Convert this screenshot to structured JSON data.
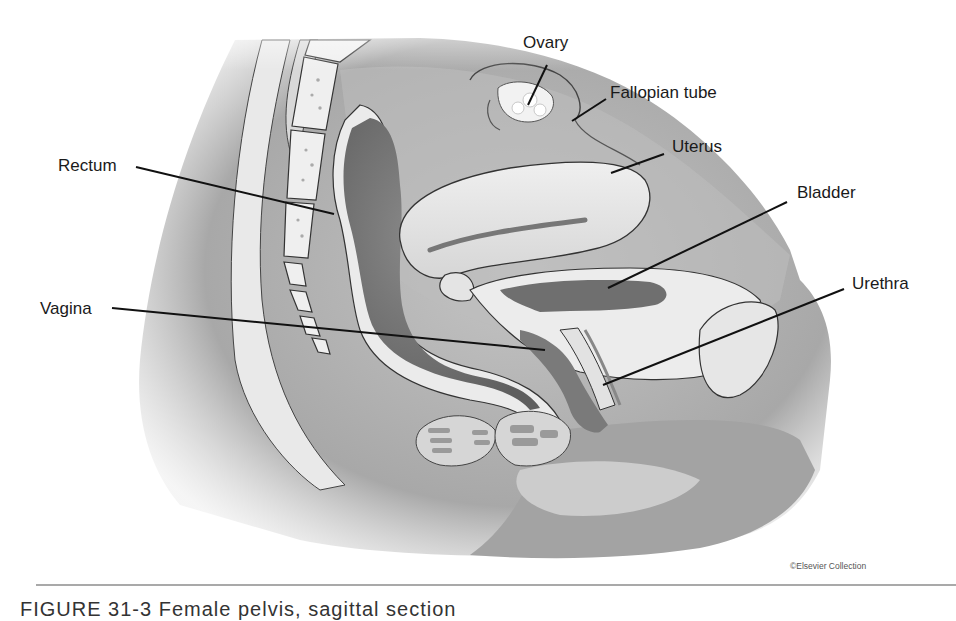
{
  "figure": {
    "type": "anatomical-illustration",
    "subject": "Female pelvis, sagittal section",
    "labels": [
      {
        "id": "ovary",
        "text": "Ovary",
        "x": 523,
        "y": 42,
        "line": [
          [
            547,
            65
          ],
          [
            528,
            105
          ]
        ]
      },
      {
        "id": "fallopian-tube",
        "text": "Fallopian tube",
        "x": 610,
        "y": 92,
        "line": [
          [
            606,
            99
          ],
          [
            572,
            121
          ]
        ]
      },
      {
        "id": "uterus",
        "text": "Uterus",
        "x": 672,
        "y": 146,
        "line": [
          [
            664,
            154
          ],
          [
            611,
            173
          ]
        ]
      },
      {
        "id": "bladder",
        "text": "Bladder",
        "x": 797,
        "y": 192,
        "line": [
          [
            787,
            202
          ],
          [
            608,
            288
          ]
        ]
      },
      {
        "id": "urethra",
        "text": "Urethra",
        "x": 852,
        "y": 283,
        "line": [
          [
            844,
            289
          ],
          [
            603,
            385
          ]
        ]
      },
      {
        "id": "rectum",
        "text": "Rectum",
        "x": 58,
        "y": 156,
        "line": [
          [
            136,
            167
          ],
          [
            334,
            214
          ]
        ]
      },
      {
        "id": "vagina",
        "text": "Vagina",
        "x": 40,
        "y": 300,
        "line": [
          [
            112,
            308
          ],
          [
            545,
            350
          ]
        ]
      }
    ],
    "copyright": "©Elsevier Collection",
    "caption": "FIGURE 31-3  Female pelvis, sagittal section"
  },
  "colors": {
    "background": "#ffffff",
    "skin_shadow": "#9a9a9a",
    "tissue_mid": "#b5b5b5",
    "tissue_light": "#e8e8e8",
    "organ_dark": "#6e6e6e",
    "line": "#111111",
    "rule": "#a9a9a9"
  }
}
